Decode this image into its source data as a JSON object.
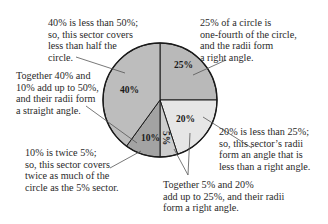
{
  "chart_data": {
    "type": "pie",
    "title": "",
    "start_angle_deg": 0,
    "direction": "clockwise",
    "slices": [
      {
        "label": "25%",
        "value": 25,
        "color": "#b9b9b9"
      },
      {
        "label": "20%",
        "value": 20,
        "color": "#e6e6e6"
      },
      {
        "label": "5%",
        "value": 5,
        "color": "#cdcdcd"
      },
      {
        "label": "10%",
        "value": 10,
        "color": "#a3a3a3"
      },
      {
        "label": "40%",
        "value": 40,
        "color": "#bdbdbd"
      }
    ],
    "annotations": [
      {
        "id": "a40",
        "text": "40% is less than 50%;\nso, this sector covers\nless than half the\ncircle."
      },
      {
        "id": "a40_10",
        "text": "Together 40% and\n10% add up to 50%,\nand their radii form\na straight angle."
      },
      {
        "id": "a25",
        "text": "25% of a circle is\none-fourth of the circle,\nand the radii form\na right angle."
      },
      {
        "id": "a20",
        "text": "20% is less than 25%;\nso, this sector’s radii\nform an angle that is\nless than a right angle."
      },
      {
        "id": "a10",
        "text": "10% is twice 5%;\nso, this sector covers\ntwice as much of the\ncircle as the 5% sector."
      },
      {
        "id": "a5_20",
        "text": "Together 5% and 20%\nadd up to 25%, and their radii\nform a right angle."
      }
    ]
  },
  "colors": {
    "outline": "#1a1a1a",
    "leader": "#555555"
  }
}
